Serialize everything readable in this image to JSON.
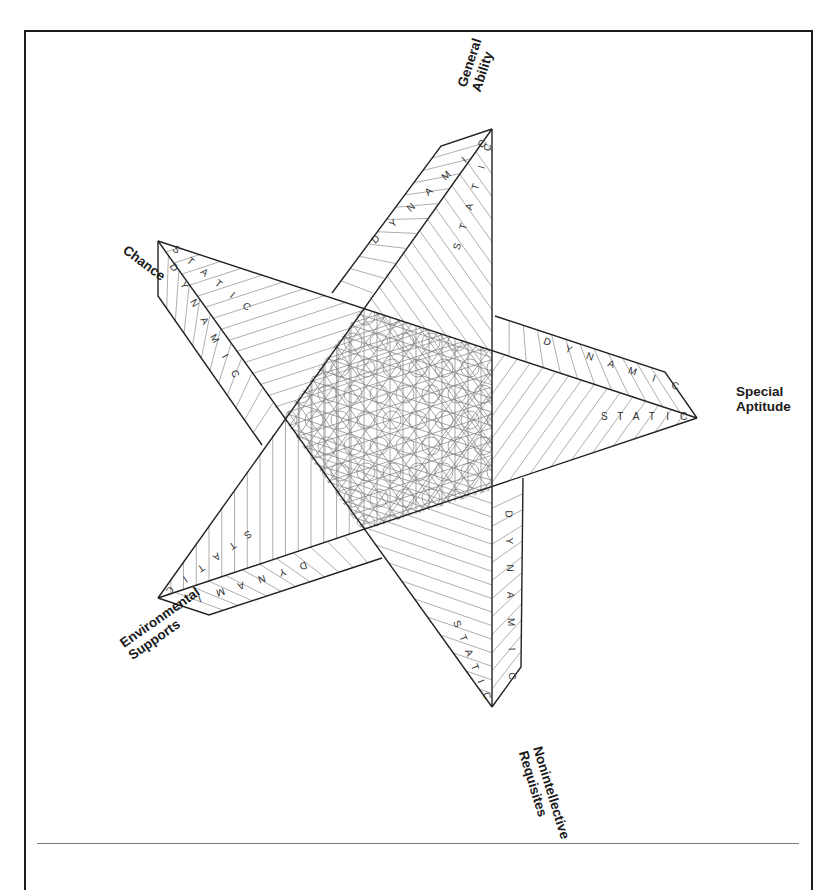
{
  "figure": {
    "type": "five-pointed star diagram",
    "center": [
      414,
      420
    ],
    "arms": [
      {
        "id": "general-ability",
        "label_lines": [
          "General",
          "Ability"
        ],
        "apex": [
          492,
          129
        ],
        "static_label": "STATIC",
        "dynamic_label": "DYNAMIC",
        "label_pos": [
          466,
          88
        ],
        "label_rotate": -72
      },
      {
        "id": "special-aptitude",
        "label_lines": [
          "Special",
          "Aptitude"
        ],
        "apex": [
          697,
          418
        ],
        "static_label": "STATIC",
        "dynamic_label": "DYNAMIC",
        "label_pos": [
          736,
          396
        ],
        "label_rotate": 0
      },
      {
        "id": "nonintellective-requisites",
        "label_lines": [
          "Nonintellective",
          "Requisites"
        ],
        "apex": [
          492,
          707
        ],
        "static_label": "STATIC",
        "dynamic_label": "DYNAMIC",
        "label_pos": [
          533,
          748
        ],
        "label_rotate": 73
      },
      {
        "id": "environmental-supports",
        "label_lines": [
          "Environmental",
          "Supports"
        ],
        "apex": [
          158,
          598
        ],
        "static_label": "STATIC",
        "dynamic_label": "DYNAMIC",
        "label_pos": [
          124,
          648
        ],
        "label_rotate": -35
      },
      {
        "id": "chance",
        "label_lines": [
          "Chance"
        ],
        "apex": [
          158,
          241
        ],
        "static_label": "STATIC",
        "dynamic_label": "DYNAMIC",
        "label_pos": [
          122,
          252
        ],
        "label_rotate": 37
      }
    ],
    "strip_words": [
      "STATIC",
      "DYNAMIC"
    ],
    "colors": {
      "edge": "#222222",
      "hatch": "#8c8c8c",
      "label": "#1a1a1a",
      "frame": "#1c1c1c",
      "rule": "#7a7a7a"
    }
  }
}
